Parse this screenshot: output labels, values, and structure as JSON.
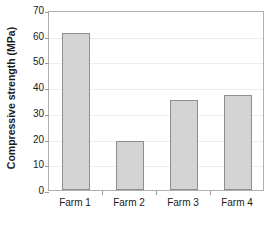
{
  "chart_data": {
    "type": "bar",
    "title": "",
    "xlabel": "",
    "ylabel": "Compressive strength (MPa)",
    "categories": [
      "Farm 1",
      "Farm 2",
      "Farm 3",
      "Farm 4"
    ],
    "values": [
      61,
      19,
      35,
      37
    ],
    "ylim": [
      0,
      70
    ],
    "ytick_step": 10,
    "yticks": [
      0,
      10,
      20,
      30,
      40,
      50,
      60,
      70
    ],
    "ytick_labels": [
      "0",
      "10",
      "20",
      "30",
      "40",
      "50",
      "60",
      "70"
    ],
    "grid": true,
    "grid_axis": "y",
    "legend": false,
    "legend_position": "none",
    "colors": {
      "bar_fill": "#d4d4d4",
      "bar_edge": "#8e8e8e",
      "gridline": "#ededed",
      "axis": "#b0b0b0",
      "text": "#1b1b1b",
      "background": "#ffffff"
    }
  }
}
